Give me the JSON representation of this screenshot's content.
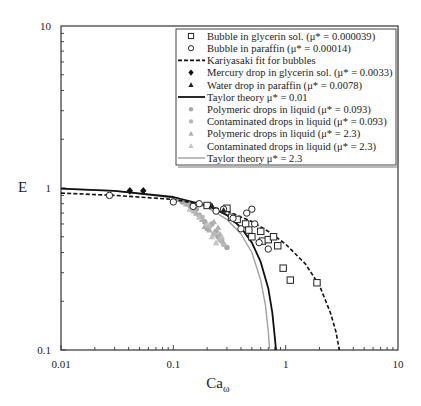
{
  "chart_data": {
    "type": "scatter",
    "title": "",
    "xlabel": "Ca",
    "xlabel_subscript": "ω",
    "ylabel": "E",
    "xscale": "log",
    "yscale": "log",
    "xlim": [
      0.01,
      10
    ],
    "ylim": [
      0.1,
      10
    ],
    "x_ticks": [
      "0.01",
      "0.1",
      "1",
      "10"
    ],
    "y_ticks": [
      "0.1",
      "1",
      "10"
    ],
    "grid": false,
    "legend_position": "upper right (inside)",
    "series": [
      {
        "name": "Bubble in glycerin sol. (μ* = 0.000039)",
        "kind": "scatter",
        "marker": "square-open",
        "color": "#222222",
        "points": [
          [
            0.2,
            0.78
          ],
          [
            0.3,
            0.75
          ],
          [
            0.33,
            0.66
          ],
          [
            0.37,
            0.64
          ],
          [
            0.44,
            0.6
          ],
          [
            0.47,
            0.55
          ],
          [
            0.5,
            0.5
          ],
          [
            0.6,
            0.54
          ],
          [
            0.62,
            0.47
          ],
          [
            0.7,
            0.48
          ],
          [
            0.78,
            0.5
          ],
          [
            0.85,
            0.44
          ],
          [
            0.95,
            0.32
          ],
          [
            1.1,
            0.27
          ],
          [
            1.9,
            0.26
          ]
        ]
      },
      {
        "name": "Bubble in paraffin (μ* = 0.00014)",
        "kind": "scatter",
        "marker": "circle-open",
        "color": "#222222",
        "points": [
          [
            0.027,
            0.9
          ],
          [
            0.1,
            0.82
          ],
          [
            0.15,
            0.77
          ],
          [
            0.17,
            0.8
          ],
          [
            0.24,
            0.72
          ],
          [
            0.28,
            0.74
          ],
          [
            0.34,
            0.65
          ],
          [
            0.4,
            0.56
          ],
          [
            0.45,
            0.7
          ],
          [
            0.5,
            0.74
          ],
          [
            0.53,
            0.6
          ],
          [
            0.58,
            0.46
          ],
          [
            0.7,
            0.42
          ]
        ]
      },
      {
        "name": "Kariyasaki fit for bubbles",
        "kind": "line",
        "style": "dashed",
        "color": "#111111",
        "points": [
          [
            0.01,
            0.93
          ],
          [
            0.03,
            0.9
          ],
          [
            0.1,
            0.85
          ],
          [
            0.2,
            0.78
          ],
          [
            0.3,
            0.72
          ],
          [
            0.5,
            0.62
          ],
          [
            0.7,
            0.54
          ],
          [
            1.0,
            0.45
          ],
          [
            1.5,
            0.34
          ],
          [
            2.0,
            0.25
          ],
          [
            2.5,
            0.17
          ],
          [
            2.8,
            0.13
          ],
          [
            3.0,
            0.1
          ]
        ]
      },
      {
        "name": "Mercury drop in glycerin sol. (μ* = 0.0033)",
        "kind": "scatter",
        "marker": "diamond-filled",
        "color": "#111111",
        "points": [
          [
            0.041,
            0.96
          ],
          [
            0.054,
            0.96
          ]
        ]
      },
      {
        "name": "Water drop in paraffin (μ* = 0.0078)",
        "kind": "scatter",
        "marker": "triangle-filled",
        "color": "#222222",
        "points": [
          [
            0.22,
            0.78
          ],
          [
            0.28,
            0.73
          ]
        ]
      },
      {
        "name": "Taylor theory μ* = 0.01",
        "kind": "line",
        "style": "solid",
        "color": "#111111",
        "width": 1.8,
        "points": [
          [
            0.01,
            0.99
          ],
          [
            0.03,
            0.96
          ],
          [
            0.1,
            0.88
          ],
          [
            0.2,
            0.78
          ],
          [
            0.3,
            0.68
          ],
          [
            0.4,
            0.57
          ],
          [
            0.5,
            0.46
          ],
          [
            0.6,
            0.35
          ],
          [
            0.7,
            0.24
          ],
          [
            0.76,
            0.17
          ],
          [
            0.8,
            0.12
          ],
          [
            0.82,
            0.1
          ]
        ]
      },
      {
        "name": "Polymeric drops in liquid (μ* = 0.093)",
        "kind": "scatter",
        "marker": "circle-filled",
        "color": "#a8a8a8",
        "points": [
          [
            0.12,
            0.82
          ],
          [
            0.14,
            0.78
          ],
          [
            0.16,
            0.74
          ],
          [
            0.17,
            0.68
          ],
          [
            0.19,
            0.62
          ],
          [
            0.2,
            0.56
          ],
          [
            0.22,
            0.6
          ],
          [
            0.24,
            0.54
          ],
          [
            0.25,
            0.5
          ],
          [
            0.27,
            0.47
          ],
          [
            0.3,
            0.43
          ]
        ]
      },
      {
        "name": "Contaminated drops in liquid (μ* = 0.093)",
        "kind": "scatter",
        "marker": "circle-filled",
        "color": "#b8b8b8",
        "points": [
          [
            0.13,
            0.8
          ],
          [
            0.15,
            0.72
          ],
          [
            0.18,
            0.66
          ],
          [
            0.21,
            0.58
          ],
          [
            0.23,
            0.52
          ],
          [
            0.26,
            0.48
          ],
          [
            0.28,
            0.45
          ]
        ]
      },
      {
        "name": "Polymeric drops in liquid (μ* = 2.3)",
        "kind": "scatter",
        "marker": "triangle-filled",
        "color": "#b0b0b0",
        "points": [
          [
            0.11,
            0.85
          ],
          [
            0.13,
            0.8
          ],
          [
            0.15,
            0.76
          ],
          [
            0.16,
            0.7
          ],
          [
            0.18,
            0.64
          ],
          [
            0.19,
            0.58
          ],
          [
            0.21,
            0.55
          ],
          [
            0.23,
            0.62
          ],
          [
            0.25,
            0.57
          ],
          [
            0.26,
            0.52
          ]
        ]
      },
      {
        "name": "Contaminated drops in liquid (μ* = 2.3)",
        "kind": "scatter",
        "marker": "triangle-filled",
        "color": "#c2c2c2",
        "points": [
          [
            0.14,
            0.74
          ],
          [
            0.17,
            0.66
          ],
          [
            0.2,
            0.6
          ],
          [
            0.22,
            0.5
          ],
          [
            0.24,
            0.46
          ],
          [
            0.27,
            0.5
          ]
        ]
      },
      {
        "name": "Taylor theory μ* = 2.3",
        "kind": "line",
        "style": "solid",
        "color": "#a0a0a0",
        "width": 1.4,
        "points": [
          [
            0.01,
            0.99
          ],
          [
            0.03,
            0.96
          ],
          [
            0.1,
            0.87
          ],
          [
            0.2,
            0.76
          ],
          [
            0.3,
            0.64
          ],
          [
            0.4,
            0.52
          ],
          [
            0.5,
            0.4
          ],
          [
            0.6,
            0.27
          ],
          [
            0.66,
            0.19
          ],
          [
            0.7,
            0.13
          ],
          [
            0.72,
            0.1
          ]
        ]
      }
    ]
  },
  "layout": {
    "plot": {
      "left": 61,
      "top": 26,
      "right": 398,
      "bottom": 350
    },
    "legend": {
      "left": 176,
      "top": 29,
      "right": 396,
      "bottom": 165,
      "row_height": 12.2
    }
  }
}
